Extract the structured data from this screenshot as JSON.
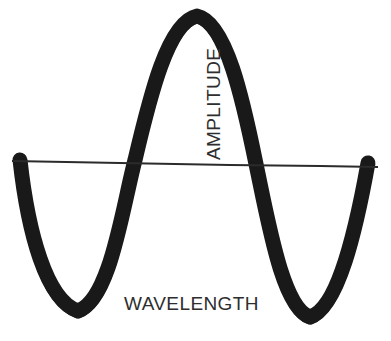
{
  "diagram": {
    "type": "wave-illustration",
    "background_color": "#ffffff",
    "stroke_color": "#1a1a1a",
    "axis_color": "#2b2b2b",
    "label_color": "#2e2e2e",
    "labels": {
      "amplitude": "AMPLITUDE",
      "wavelength": "WAVELENGTH"
    },
    "geometry": {
      "width": 391,
      "height": 341,
      "axis": {
        "x_start": 12,
        "y_start": 161,
        "x_end": 378,
        "y_end": 167,
        "thickness": 2
      },
      "wave_stroke_width": 15,
      "wave_points": {
        "start": [
          20,
          162
        ],
        "trough_left": [
          78,
          312
        ],
        "crossing_up": [
          135,
          163
        ],
        "peak": [
          197,
          16
        ],
        "crossing_down": [
          256,
          165
        ],
        "trough_right": [
          310,
          318
        ],
        "end": [
          368,
          164
        ]
      }
    }
  }
}
